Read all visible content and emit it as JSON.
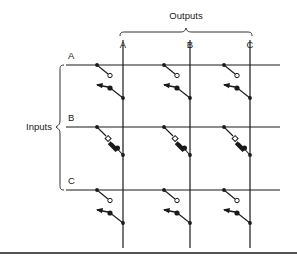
{
  "figure": {
    "title": "",
    "type": "crossbar-switch-matrix",
    "background_color": "#ffffff",
    "line_color": "#1a1a1a",
    "text_color": "#1a1a1a"
  },
  "groups": {
    "outputs": {
      "label": "Outputs",
      "brace": "horizontal-curly-brace-down",
      "x_start": 120,
      "x_end": 252,
      "y": 32,
      "label_x": 186,
      "label_y": 19
    },
    "inputs": {
      "label": "Inputs",
      "brace": "vertical-curly-brace-right",
      "y_start": 65,
      "y_end": 190,
      "x": 60,
      "label_x": 38,
      "label_y": 130
    }
  },
  "columns": [
    {
      "label": "A",
      "x": 123,
      "label_y": 48
    },
    {
      "label": "B",
      "x": 190,
      "label_y": 48
    },
    {
      "label": "C",
      "x": 250,
      "label_y": 48
    }
  ],
  "rows": [
    {
      "label": "A",
      "y": 65,
      "label_x": 68,
      "label_y": 59
    },
    {
      "label": "B",
      "y": 127,
      "label_x": 68,
      "label_y": 121
    },
    {
      "label": "C",
      "y": 190,
      "label_x": 68,
      "label_y": 184
    }
  ],
  "grid": {
    "row_line_x_start": 66,
    "row_line_x_end": 280,
    "col_line_y_start": 40,
    "col_line_y_end": 248,
    "line_width": 1.2
  },
  "crosspoints": [
    {
      "row": "A",
      "col": "A",
      "arrow_style": "horizontal",
      "state": "open"
    },
    {
      "row": "A",
      "col": "B",
      "arrow_style": "horizontal",
      "state": "open"
    },
    {
      "row": "A",
      "col": "C",
      "arrow_style": "horizontal",
      "state": "open"
    },
    {
      "row": "B",
      "col": "A",
      "arrow_style": "diagonal",
      "state": "open"
    },
    {
      "row": "B",
      "col": "B",
      "arrow_style": "diagonal",
      "state": "open"
    },
    {
      "row": "B",
      "col": "C",
      "arrow_style": "diagonal",
      "state": "open"
    },
    {
      "row": "C",
      "col": "A",
      "arrow_style": "horizontal",
      "state": "open"
    },
    {
      "row": "C",
      "col": "B",
      "arrow_style": "horizontal",
      "state": "open"
    },
    {
      "row": "C",
      "col": "C",
      "arrow_style": "horizontal",
      "state": "open"
    }
  ],
  "footer_rule": {
    "y": 253,
    "x_start": 0,
    "x_end": 297
  }
}
